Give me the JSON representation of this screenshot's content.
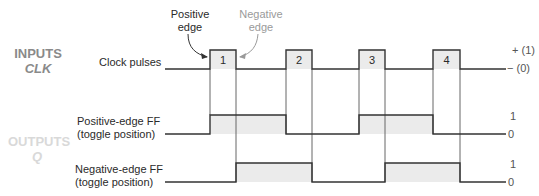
{
  "sections": {
    "inputs": {
      "title": "INPUTS",
      "sub": "CLK"
    },
    "outputs": {
      "title": "OUTPUTS",
      "sub": "Q"
    }
  },
  "annotations": {
    "positive_edge": [
      "Positive",
      "edge"
    ],
    "negative_edge": [
      "Negative",
      "edge"
    ]
  },
  "signals": {
    "clock": {
      "label": "Clock pulses",
      "high_label": "+ (1)",
      "low_label": "− (0)",
      "pulses": [
        "1",
        "2",
        "3",
        "4"
      ]
    },
    "pos_ff": {
      "label_line1": "Positive-edge FF",
      "label_line2": "(toggle position)",
      "high_label": "1",
      "low_label": "0"
    },
    "neg_ff": {
      "label_line1": "Negative-edge FF",
      "label_line2": "(toggle position)",
      "high_label": "1",
      "low_label": "0"
    }
  },
  "colors": {
    "line": "#333333",
    "fill": "#ebebeb",
    "guide": "#555555",
    "neg_annot": "#9a9a9a"
  }
}
